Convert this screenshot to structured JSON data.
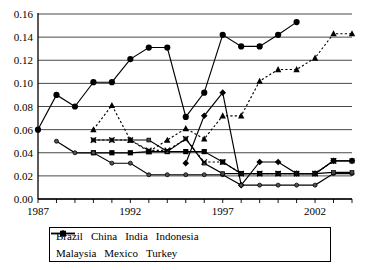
{
  "title_fragment": "",
  "legend": {
    "position": "below-axis",
    "rows": [
      [
        "Brazil",
        "China",
        "India",
        "Indonesia"
      ],
      [
        "Malaysia",
        "Mexico",
        "Turkey"
      ]
    ]
  },
  "axes": {
    "y_ticks": [
      "0.00",
      "0.02",
      "0.04",
      "0.06",
      "0.08",
      "0.10",
      "0.12",
      "0.14",
      "0.16"
    ],
    "x_ticks": [
      "1987",
      "1992",
      "1997",
      "2002"
    ],
    "ylim": [
      0,
      0.16
    ],
    "xlim": [
      1987,
      2004
    ],
    "grid": "horizontal"
  },
  "chart_data": {
    "type": "line",
    "title": "",
    "xlabel": "",
    "ylabel": "",
    "ylim": [
      0,
      0.16
    ],
    "xlim": [
      1987,
      2004
    ],
    "grid": true,
    "legend_position": "bottom",
    "x": [
      1987,
      1988,
      1989,
      1990,
      1991,
      1992,
      1993,
      1994,
      1995,
      1996,
      1997,
      1998,
      1999,
      2000,
      2001,
      2002,
      2003,
      2004
    ],
    "series": [
      {
        "name": "Brazil",
        "marker": "diamond",
        "line": "solid",
        "color": "#000000",
        "x": [
          1995,
          1996,
          1997,
          1998,
          1999,
          2000,
          2001,
          2002,
          2003,
          2004
        ],
        "values": [
          0.031,
          0.072,
          0.092,
          0.012,
          0.032,
          0.032,
          0.022,
          0.022,
          0.033,
          0.033
        ]
      },
      {
        "name": "China",
        "marker": "square",
        "line": "solid",
        "color": "#000000",
        "x": [
          1990,
          1991,
          1992,
          1993,
          1994,
          1995,
          1996,
          1997,
          1998,
          1999,
          2000,
          2001,
          2002,
          2003,
          2004
        ],
        "values": [
          0.04,
          0.04,
          0.04,
          0.041,
          0.041,
          0.041,
          0.041,
          0.032,
          0.022,
          0.022,
          0.022,
          0.022,
          0.022,
          0.033,
          0.033
        ]
      },
      {
        "name": "India",
        "marker": "circle-small",
        "line": "solid",
        "color": "#000000",
        "x": [
          1988,
          1989,
          1990,
          1991,
          1992,
          1993,
          1994,
          1995,
          1996,
          1997,
          1998,
          1999,
          2000,
          2001,
          2002,
          2003,
          2004
        ],
        "values": [
          0.05,
          0.04,
          0.04,
          0.031,
          0.031,
          0.021,
          0.021,
          0.021,
          0.021,
          0.021,
          0.012,
          0.012,
          0.012,
          0.012,
          0.012,
          0.022,
          0.022
        ]
      },
      {
        "name": "Indonesia",
        "marker": "square-small",
        "line": "solid",
        "color": "#000000",
        "x": [
          1990,
          1991,
          1992,
          1993,
          1994,
          1995,
          1996,
          1997,
          1998,
          1999,
          2000,
          2001,
          2002,
          2003,
          2004
        ],
        "values": [
          0.051,
          0.051,
          0.051,
          0.051,
          0.041,
          0.052,
          0.031,
          0.022,
          0.022,
          0.022,
          0.022,
          0.022,
          0.022,
          0.023,
          0.023
        ]
      },
      {
        "name": "Malaysia",
        "marker": "cross",
        "line": "dotted",
        "color": "#000000",
        "x": [
          1990,
          1991,
          1992,
          1993,
          1994,
          1995,
          1996,
          1997,
          1998,
          1999,
          2000,
          2001,
          2002,
          2003
        ],
        "values": [
          0.051,
          0.051,
          0.051,
          0.042,
          0.042,
          0.052,
          0.032,
          0.032,
          0.022,
          0.022,
          0.022,
          0.022,
          0.022,
          0.033
        ]
      },
      {
        "name": "Mexico",
        "marker": "circle",
        "line": "solid",
        "color": "#000000",
        "x": [
          1987,
          1988,
          1989,
          1990,
          1991,
          1992,
          1993,
          1994,
          1995,
          1996,
          1997,
          1998,
          1999,
          2000,
          2001
        ],
        "values": [
          0.06,
          0.09,
          0.08,
          0.101,
          0.101,
          0.121,
          0.131,
          0.131,
          0.071,
          0.092,
          0.142,
          0.132,
          0.132,
          0.142,
          0.153
        ]
      },
      {
        "name": "Turkey",
        "marker": "triangle",
        "line": "dotted",
        "color": "#000000",
        "x": [
          1990,
          1991,
          1992,
          1993,
          1994,
          1995,
          1996,
          1997,
          1998,
          1999,
          2000,
          2001,
          2002,
          2003,
          2004
        ],
        "values": [
          0.06,
          0.081,
          0.051,
          0.041,
          0.051,
          0.061,
          0.052,
          0.072,
          0.072,
          0.102,
          0.112,
          0.112,
          0.122,
          0.143,
          0.143
        ]
      }
    ]
  }
}
